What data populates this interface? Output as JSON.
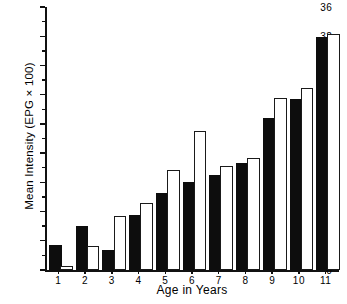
{
  "chart_data": {
    "type": "bar",
    "title": "",
    "xlabel": "Age in Years",
    "ylabel": "Mean Intensity (EPG × 100)",
    "categories": [
      "1",
      "2",
      "3",
      "4",
      "5",
      "6",
      "7",
      "8",
      "9",
      "10",
      "11"
    ],
    "series": [
      {
        "name": "filled-bar",
        "style": "solid-black",
        "values": [
          3.2,
          5.8,
          2.5,
          7.3,
          10.2,
          11.8,
          12.7,
          14.4,
          20.5,
          23.1,
          31.6
        ]
      },
      {
        "name": "open-bar",
        "style": "white-outline",
        "values": [
          0.3,
          3.0,
          7.1,
          8.9,
          13.4,
          18.7,
          14.0,
          15.0,
          23.3,
          24.6,
          32.0
        ]
      }
    ],
    "ylim": [
      0,
      36
    ],
    "yticks": [
      0,
      4,
      8,
      12,
      16,
      20,
      24,
      28,
      32,
      36
    ],
    "ytick_labels": [
      "0",
      "4",
      "8",
      "12",
      "16",
      "20",
      "24",
      "28",
      "32",
      "36"
    ],
    "yminor_ticks": [
      2,
      6,
      10,
      14,
      18,
      22,
      26,
      30,
      34
    ],
    "grid": false,
    "legend": null,
    "colors": {
      "filled": "#0d0d0d",
      "open": "#ffffff",
      "outline": "#1a1a1a",
      "axis": "#111111",
      "background": "#ffffff"
    }
  }
}
